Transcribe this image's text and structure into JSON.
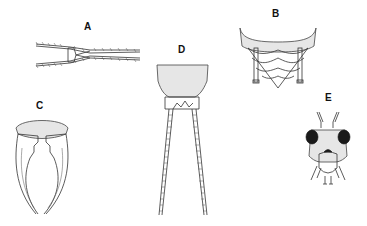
{
  "figure": {
    "panels": [
      {
        "id": "A",
        "label": "A",
        "subject": "cerci (dorsal, slender, setose)"
      },
      {
        "id": "B",
        "label": "B",
        "subject": "abdomen apex with cerci"
      },
      {
        "id": "C",
        "label": "C",
        "subject": "forceps-like cerci"
      },
      {
        "id": "D",
        "label": "D",
        "subject": "abdomen apex with long segmented cerci"
      },
      {
        "id": "E",
        "label": "E",
        "subject": "head, frontal view"
      }
    ],
    "colors": {
      "ink": "#333333",
      "background": "#ffffff",
      "eye": "#1a1a1a"
    }
  }
}
